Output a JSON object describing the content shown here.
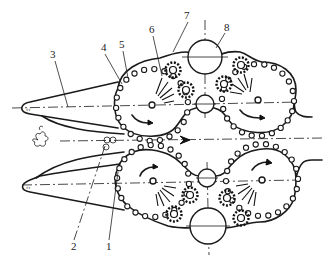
{
  "diagram": {
    "type": "mechanical schematic",
    "labels": [
      {
        "id": "1",
        "text": "1",
        "x": 106,
        "y": 250
      },
      {
        "id": "2",
        "text": "2",
        "x": 71,
        "y": 250
      },
      {
        "id": "3",
        "text": "3",
        "x": 50,
        "y": 58
      },
      {
        "id": "4",
        "text": "4",
        "x": 101,
        "y": 51
      },
      {
        "id": "5",
        "text": "5",
        "x": 119,
        "y": 48
      },
      {
        "id": "6",
        "text": "6",
        "x": 149,
        "y": 33
      },
      {
        "id": "7",
        "text": "7",
        "x": 184,
        "y": 19
      },
      {
        "id": "8",
        "text": "8",
        "x": 224,
        "y": 31
      }
    ],
    "colors": {
      "line": "#1a1a1a",
      "background": "#ffffff"
    }
  }
}
